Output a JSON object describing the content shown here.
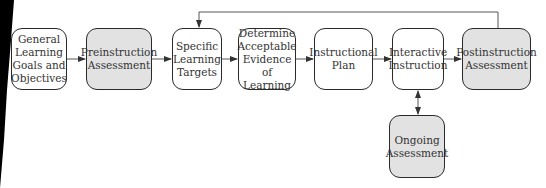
{
  "diagram": {
    "type": "flowchart",
    "colors": {
      "shaded_fill": "#e2e2e2",
      "border": "#2a2a2a",
      "text": "#333333"
    },
    "nodes": [
      {
        "id": "goals",
        "label": "General\nLearning\nGoals and\nObjectives",
        "shaded": false
      },
      {
        "id": "pre",
        "label": "Preinstruction\nAssessment",
        "shaded": true
      },
      {
        "id": "targets",
        "label": "Specific\nLearning\nTargets",
        "shaded": false
      },
      {
        "id": "evidence",
        "label": "Determine\nAcceptable\nEvidence\nof Learning",
        "shaded": false
      },
      {
        "id": "plan",
        "label": "Instructional\nPlan",
        "shaded": false
      },
      {
        "id": "interactive",
        "label": "Interactive\nInstruction",
        "shaded": false
      },
      {
        "id": "post",
        "label": "Postinstruction\nAssessment",
        "shaded": true
      },
      {
        "id": "ongoing",
        "label": "Ongoing\nAssessment",
        "shaded": true
      }
    ],
    "edges": [
      {
        "from": "goals",
        "to": "pre"
      },
      {
        "from": "pre",
        "to": "targets"
      },
      {
        "from": "targets",
        "to": "evidence"
      },
      {
        "from": "evidence",
        "to": "plan"
      },
      {
        "from": "plan",
        "to": "interactive"
      },
      {
        "from": "interactive",
        "to": "post"
      },
      {
        "from": "interactive",
        "to": "ongoing",
        "bidirectional": true
      },
      {
        "from": "post",
        "to": "targets",
        "type": "feedback-loop"
      }
    ]
  }
}
